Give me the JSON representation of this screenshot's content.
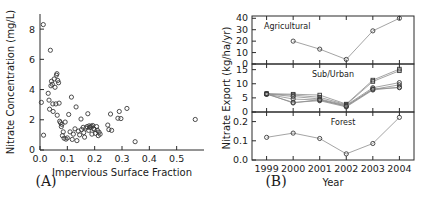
{
  "figure": {
    "panel_a_letter": "(A)",
    "panel_b_letter": "(B)"
  },
  "chart_data": [
    {
      "type": "scatter",
      "panel": "A",
      "title": "",
      "xlabel": "Impervious Surface Fraction",
      "ylabel": "Nitrate Concentration (mg/L)",
      "xlim": [
        0.0,
        0.6
      ],
      "ylim": [
        0,
        9
      ],
      "xticks": [
        0.0,
        0.1,
        0.2,
        0.3,
        0.4,
        0.5
      ],
      "xticklabels": [
        "0.0",
        "0.1",
        "0.2",
        "0.3",
        "0.4",
        "0.5"
      ],
      "yticks": [
        0,
        2,
        4,
        6,
        8
      ],
      "yticklabels": [
        "0",
        "2",
        "4",
        "6",
        "8"
      ],
      "grid": false,
      "marker": "open-circle",
      "points": [
        [
          0.005,
          3.15
        ],
        [
          0.012,
          8.3
        ],
        [
          0.013,
          0.98
        ],
        [
          0.03,
          3.75
        ],
        [
          0.033,
          3.3
        ],
        [
          0.035,
          2.7
        ],
        [
          0.038,
          6.6
        ],
        [
          0.04,
          4.25
        ],
        [
          0.042,
          4.55
        ],
        [
          0.045,
          4.35
        ],
        [
          0.047,
          3.05
        ],
        [
          0.048,
          2.55
        ],
        [
          0.052,
          4.7
        ],
        [
          0.055,
          4.15
        ],
        [
          0.058,
          3.05
        ],
        [
          0.06,
          4.95
        ],
        [
          0.062,
          5.05
        ],
        [
          0.063,
          2.3
        ],
        [
          0.065,
          4.6
        ],
        [
          0.068,
          4.45
        ],
        [
          0.07,
          3.1
        ],
        [
          0.072,
          1.9
        ],
        [
          0.075,
          1.8
        ],
        [
          0.078,
          1.55
        ],
        [
          0.08,
          1.7
        ],
        [
          0.082,
          0.95
        ],
        [
          0.085,
          1.2
        ],
        [
          0.088,
          0.78
        ],
        [
          0.092,
          1.85
        ],
        [
          0.095,
          0.72
        ],
        [
          0.1,
          0.8
        ],
        [
          0.105,
          2.35
        ],
        [
          0.11,
          1.2
        ],
        [
          0.115,
          3.5
        ],
        [
          0.118,
          0.7
        ],
        [
          0.122,
          1.05
        ],
        [
          0.128,
          1.4
        ],
        [
          0.132,
          2.85
        ],
        [
          0.135,
          0.62
        ],
        [
          0.14,
          1.25
        ],
        [
          0.145,
          1.0
        ],
        [
          0.15,
          2.05
        ],
        [
          0.152,
          1.35
        ],
        [
          0.158,
          1.5
        ],
        [
          0.16,
          1.15
        ],
        [
          0.163,
          0.85
        ],
        [
          0.168,
          1.45
        ],
        [
          0.172,
          1.55
        ],
        [
          0.175,
          2.4
        ],
        [
          0.178,
          1.3
        ],
        [
          0.18,
          1.6
        ],
        [
          0.182,
          1.48
        ],
        [
          0.185,
          1.52
        ],
        [
          0.188,
          1.58
        ],
        [
          0.19,
          1.05
        ],
        [
          0.193,
          1.62
        ],
        [
          0.196,
          1.42
        ],
        [
          0.2,
          1.35
        ],
        [
          0.203,
          1.1
        ],
        [
          0.207,
          1.55
        ],
        [
          0.21,
          1.3
        ],
        [
          0.213,
          0.95
        ],
        [
          0.216,
          1.18
        ],
        [
          0.22,
          1.05
        ],
        [
          0.248,
          1.65
        ],
        [
          0.252,
          1.35
        ],
        [
          0.258,
          2.38
        ],
        [
          0.262,
          1.3
        ],
        [
          0.285,
          2.1
        ],
        [
          0.29,
          2.55
        ],
        [
          0.296,
          2.08
        ],
        [
          0.318,
          2.75
        ],
        [
          0.348,
          0.55
        ],
        [
          0.568,
          2.02
        ]
      ]
    },
    {
      "type": "line",
      "panel": "B",
      "title": "",
      "xlabel": "Year",
      "ylabel": "Nitrate Export (kg/ha/yr)",
      "x": [
        1999,
        2000,
        2001,
        2002,
        2003,
        2004
      ],
      "xticklabels": [
        "1999",
        "2000",
        "2001",
        "2002",
        "2003",
        "2004"
      ],
      "grid": false,
      "subplots": [
        {
          "name": "Agricultural",
          "annotation": "Agricultural",
          "ylim": [
            0,
            42
          ],
          "yticks": [
            0,
            10,
            20,
            30,
            40
          ],
          "yticklabels": [
            "0",
            "10",
            "20",
            "30",
            "40"
          ],
          "series": [
            {
              "name": "Agricultural",
              "marker": "open-circle",
              "x": [
                2000,
                2001,
                2002,
                2003,
                2004
              ],
              "values": [
                20.0,
                13.0,
                4.0,
                29.0,
                40.0
              ]
            }
          ]
        },
        {
          "name": "Sub/Urban",
          "annotation": "Sub/Urban",
          "ylim": [
            0,
            17
          ],
          "yticks": [
            0,
            5,
            10,
            15
          ],
          "yticklabels": [
            "0",
            "5",
            "10",
            "15"
          ],
          "series": [
            {
              "name": "Sub/Urban 1",
              "marker": "open-square",
              "x": [
                1999,
                2000,
                2001,
                2002,
                2003,
                2004
              ],
              "values": [
                6.5,
                6.3,
                6.0,
                2.8,
                11.3,
                15.2
              ]
            },
            {
              "name": "Sub/Urban 2",
              "marker": "open-square",
              "x": [
                1999,
                2000,
                2001,
                2002,
                2003,
                2004
              ],
              "values": [
                6.4,
                6.0,
                5.2,
                2.6,
                10.8,
                14.6
              ]
            },
            {
              "name": "Sub/Urban 3",
              "marker": "open-circle",
              "x": [
                1999,
                2000,
                2001,
                2002,
                2003,
                2004
              ],
              "values": [
                6.4,
                5.5,
                4.6,
                2.4,
                8.6,
                10.4
              ]
            },
            {
              "name": "Sub/Urban 4",
              "marker": "open-circle",
              "x": [
                1999,
                2000,
                2001,
                2002,
                2003,
                2004
              ],
              "values": [
                6.3,
                4.6,
                4.2,
                2.2,
                8.0,
                9.6
              ]
            },
            {
              "name": "Sub/Urban 5",
              "marker": "open-circle",
              "x": [
                1999,
                2000,
                2001,
                2002,
                2003,
                2004
              ],
              "values": [
                6.3,
                3.4,
                4.0,
                1.8,
                7.8,
                8.8
              ]
            },
            {
              "name": "Sub/Urban 6",
              "marker": "open-circle",
              "x": [
                1999,
                2000,
                2001,
                2002,
                2003,
                2004
              ],
              "values": [
                6.5,
                3.2,
                4.4,
                2.0,
                8.2,
                8.6
              ]
            }
          ]
        },
        {
          "name": "Forest",
          "annotation": "Forest",
          "ylim": [
            0.0,
            0.25
          ],
          "yticks": [
            0.0,
            0.1,
            0.2
          ],
          "yticklabels": [
            "0.0",
            "0.1",
            "0.2"
          ],
          "series": [
            {
              "name": "Forest",
              "marker": "open-circle",
              "x": [
                1999,
                2000,
                2001,
                2002,
                2003,
                2004
              ],
              "values": [
                0.118,
                0.14,
                0.112,
                0.032,
                0.086,
                0.222
              ]
            }
          ]
        }
      ]
    }
  ]
}
